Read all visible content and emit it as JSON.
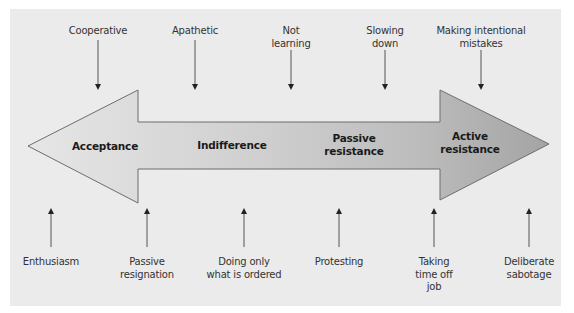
{
  "diagram": {
    "type": "spectrum-arrow",
    "colors": {
      "panel_background": "#ebebeb",
      "arrow_fill_start": "#e3e3e3",
      "arrow_fill_end": "#a8a8a8",
      "arrow_stroke": "#6d6d6d",
      "pointer_line": "#555555"
    },
    "stages": [
      {
        "id": "acceptance",
        "label": "Acceptance"
      },
      {
        "id": "indifference",
        "label": "Indifference"
      },
      {
        "id": "passive-resistance",
        "label": "Passive\nresistance"
      },
      {
        "id": "active-resistance",
        "label": "Active\nresistance"
      }
    ],
    "top_labels": [
      {
        "label": "Cooperative"
      },
      {
        "label": "Apathetic"
      },
      {
        "label": "Not\nlearning"
      },
      {
        "label": "Slowing\ndown"
      },
      {
        "label": "Making intentional\nmistakes"
      }
    ],
    "bottom_labels": [
      {
        "label": "Enthusiasm"
      },
      {
        "label": "Passive\nresignation"
      },
      {
        "label": "Doing only\nwhat is ordered"
      },
      {
        "label": "Protesting"
      },
      {
        "label": "Taking\ntime off\njob"
      },
      {
        "label": "Deliberate\nsabotage"
      }
    ]
  }
}
